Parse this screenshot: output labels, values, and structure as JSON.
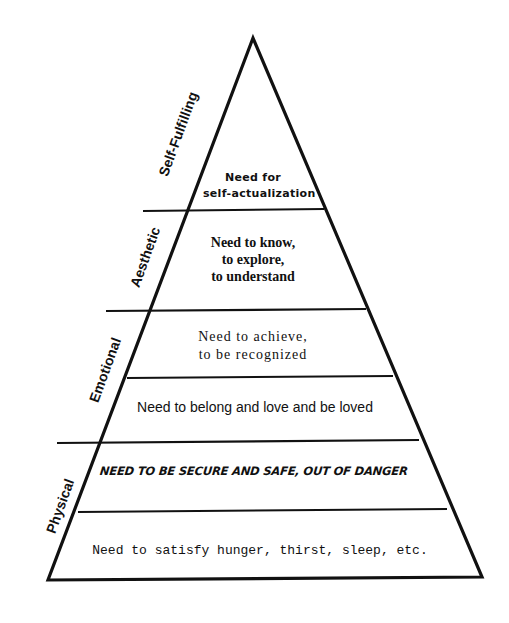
{
  "diagram": {
    "type": "pyramid",
    "colors": {
      "line": "#111111",
      "background": "#ffffff"
    },
    "categories": [
      {
        "label": "Self-Fulfilling"
      },
      {
        "label": "Aesthetic"
      },
      {
        "label": "Emotional"
      },
      {
        "label": "Physical"
      }
    ],
    "tiers": [
      {
        "lines": [
          "Need for",
          "self-actualization"
        ],
        "category": "Self-Fulfilling"
      },
      {
        "lines": [
          "Need to know,",
          "to explore,",
          "to understand"
        ],
        "category": "Aesthetic"
      },
      {
        "lines": [
          "Need to achieve,",
          "to be recognized"
        ],
        "category": "Emotional"
      },
      {
        "lines": [
          "Need to belong and love and be loved"
        ],
        "category": "Emotional"
      },
      {
        "lines": [
          "NEED TO BE SECURE AND SAFE, OUT OF DANGER"
        ],
        "category": "Physical"
      },
      {
        "lines": [
          "Need to satisfy hunger, thirst, sleep, etc."
        ],
        "category": "Physical"
      }
    ]
  }
}
